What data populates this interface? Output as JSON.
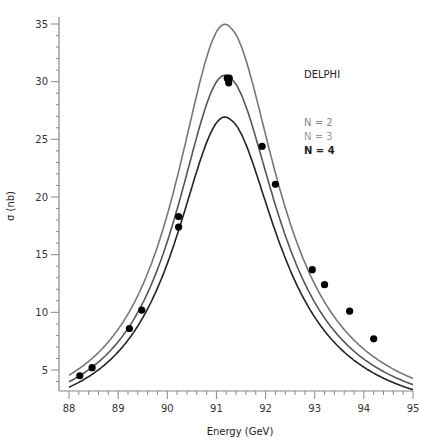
{
  "chart_data": {
    "type": "line",
    "title": "",
    "annotation": "DELPHI",
    "xlabel": "Energy (GeV)",
    "ylabel": "σ (nb)",
    "xlim": [
      88,
      95
    ],
    "ylim": [
      4,
      35.5
    ],
    "x_ticks": [
      88,
      89,
      90,
      91,
      92,
      93,
      94,
      95
    ],
    "y_ticks": [
      5,
      10,
      15,
      20,
      25,
      30,
      35
    ],
    "grid": false,
    "legend_position": "upper right",
    "series": [
      {
        "name": "N = 2",
        "kind": "curve",
        "color": "#777777",
        "peak_energy": 91.25,
        "peak": 34.8
      },
      {
        "name": "N = 3",
        "kind": "curve",
        "color": "#555555",
        "peak_energy": 91.25,
        "peak": 30.4
      },
      {
        "name": "N = 4",
        "kind": "curve",
        "color": "#222222",
        "peak_energy": 91.25,
        "peak": 26.8
      },
      {
        "name": "DELPHI data",
        "kind": "points",
        "color": "#000000",
        "x": [
          88.22,
          88.47,
          89.23,
          89.48,
          90.23,
          90.23,
          91.22,
          91.25,
          91.26,
          91.93,
          92.2,
          92.95,
          93.2,
          93.71,
          94.2
        ],
        "y": [
          4.5,
          5.2,
          8.6,
          10.2,
          17.4,
          18.3,
          30.3,
          29.9,
          30.3,
          24.4,
          21.1,
          13.7,
          12.4,
          10.1,
          7.7
        ]
      }
    ]
  },
  "legend": {
    "experiment": "DELPHI",
    "items": [
      {
        "label": "N = 2",
        "color": "#888888"
      },
      {
        "label": "N = 3",
        "color": "#999999"
      },
      {
        "label": "N = 4",
        "color": "#222222"
      }
    ]
  },
  "axes": {
    "x_title": "Energy (GeV)",
    "y_title": "σ (nb)",
    "x_tick_labels": [
      "88",
      "89",
      "90",
      "91",
      "92",
      "93",
      "94",
      "95"
    ],
    "y_tick_labels": [
      "5",
      "10",
      "15",
      "20",
      "25",
      "30",
      "35"
    ]
  }
}
